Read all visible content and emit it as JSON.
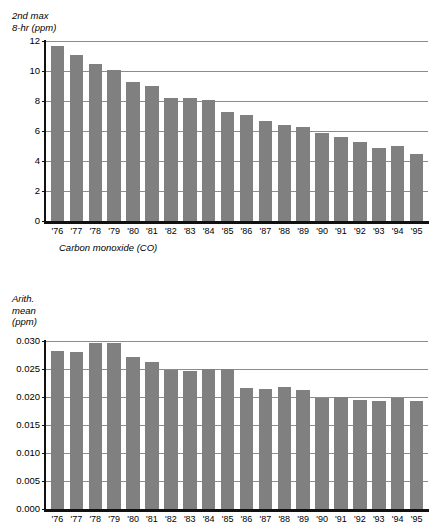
{
  "chart_data": [
    {
      "type": "bar",
      "title": "",
      "ylabel": "2nd max\n8-hr (ppm)",
      "xlabel": "",
      "caption": "Carbon monoxide (CO)",
      "ylim": [
        0,
        12
      ],
      "yticks": [
        0,
        2,
        4,
        6,
        8,
        10,
        12
      ],
      "ytick_labels": [
        "0",
        "2",
        "4",
        "6",
        "8",
        "10",
        "12"
      ],
      "grid": true,
      "legend": "none",
      "bar_color": "#808080",
      "categories": [
        "'76",
        "'77",
        "'78",
        "'79",
        "'80",
        "'81",
        "'82",
        "'83",
        "'84",
        "'85",
        "'86",
        "'87",
        "'88",
        "'89",
        "'90",
        "'91",
        "'92",
        "'93",
        "'94",
        "'95"
      ],
      "values": [
        11.65,
        11.1,
        10.45,
        10.05,
        9.3,
        9.0,
        8.2,
        8.2,
        8.1,
        7.3,
        7.1,
        6.7,
        6.4,
        6.3,
        5.9,
        5.6,
        5.25,
        4.9,
        5.0,
        4.5
      ]
    },
    {
      "type": "bar",
      "title": "",
      "ylabel": "Arith.\nmean\n(ppm)",
      "xlabel": "",
      "caption": "",
      "ylim": [
        0,
        0.03
      ],
      "yticks": [
        0,
        0.005,
        0.01,
        0.015,
        0.02,
        0.025,
        0.03
      ],
      "ytick_labels": [
        "0.000",
        "0.005",
        "0.010",
        "0.015",
        "0.020",
        "0.025",
        "0.030"
      ],
      "grid": true,
      "legend": "none",
      "bar_color": "#808080",
      "categories": [
        "'76",
        "'77",
        "'78",
        "'79",
        "'80",
        "'81",
        "'82",
        "'83",
        "'84",
        "'85",
        "'86",
        "'87",
        "'88",
        "'89",
        "'90",
        "'91",
        "'92",
        "'93",
        "'94",
        "'95"
      ],
      "values": [
        0.0283,
        0.028,
        0.0297,
        0.0297,
        0.0272,
        0.0262,
        0.0248,
        0.0247,
        0.025,
        0.025,
        0.0216,
        0.0214,
        0.0217,
        0.0212,
        0.0199,
        0.02,
        0.0195,
        0.0192,
        0.0199,
        0.0192
      ]
    }
  ]
}
